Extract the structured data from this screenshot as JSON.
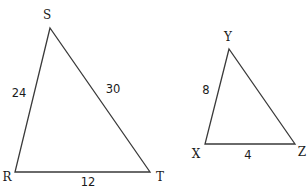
{
  "triangles": [
    {
      "name": "RST",
      "vertices": {
        "S": {
          "label": "S",
          "x": 50,
          "y": 28,
          "lx": 47,
          "ly": 19
        },
        "R": {
          "label": "R",
          "x": 15,
          "y": 172,
          "lx": 7,
          "ly": 181
        },
        "T": {
          "label": "T",
          "x": 150,
          "y": 172,
          "lx": 160,
          "ly": 181
        }
      },
      "sides": {
        "RS": {
          "label": "24",
          "x": 19,
          "y": 97
        },
        "ST": {
          "label": "30",
          "x": 113,
          "y": 93
        },
        "RT": {
          "label": "12",
          "x": 88,
          "y": 186
        }
      }
    },
    {
      "name": "XYZ",
      "vertices": {
        "Y": {
          "label": "Y",
          "x": 229,
          "y": 49,
          "lx": 228,
          "ly": 41
        },
        "X": {
          "label": "X",
          "x": 205,
          "y": 144,
          "lx": 196,
          "ly": 158
        },
        "Z": {
          "label": "Z",
          "x": 295,
          "y": 144,
          "lx": 302,
          "ly": 156
        }
      },
      "sides": {
        "XY": {
          "label": "8",
          "x": 206,
          "y": 94
        },
        "XZ": {
          "label": "4",
          "x": 248,
          "y": 159
        }
      }
    }
  ]
}
